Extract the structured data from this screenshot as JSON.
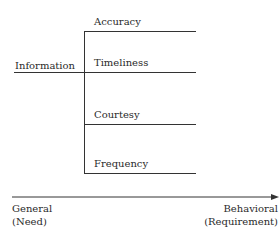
{
  "diagram": {
    "root": {
      "label": "Information"
    },
    "branches": [
      {
        "label": "Accuracy"
      },
      {
        "label": "Timeliness"
      },
      {
        "label": "Courtesy"
      },
      {
        "label": "Frequency"
      }
    ],
    "axis": {
      "left_label_line1": "General",
      "left_label_line2": "(Need)",
      "right_label_line1": "Behavioral",
      "right_label_line2": "(Requirement)"
    }
  }
}
